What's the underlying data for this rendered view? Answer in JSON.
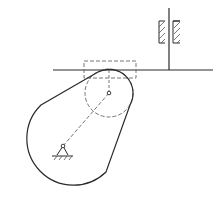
{
  "diagram": {
    "colors": {
      "line": "#2a2a2a",
      "dashed": "#555555",
      "background": "#ffffff"
    },
    "components": [
      {
        "id": "cam",
        "label": "cam-profile"
      },
      {
        "id": "follower-face",
        "label": "flat-faced follower"
      },
      {
        "id": "follower-stem",
        "label": "follower stem"
      },
      {
        "id": "guide-bearing",
        "label": "guide bearing (hatched)"
      },
      {
        "id": "roller-circle",
        "label": "dashed circle (cam lobe center circle)"
      },
      {
        "id": "dashed-rect",
        "label": "dashed rectangle (contact region)"
      },
      {
        "id": "pivot",
        "label": "fixed pivot with ground hatching"
      },
      {
        "id": "crank-line",
        "label": "dashed line pivot to circle center"
      }
    ],
    "caption": ""
  }
}
